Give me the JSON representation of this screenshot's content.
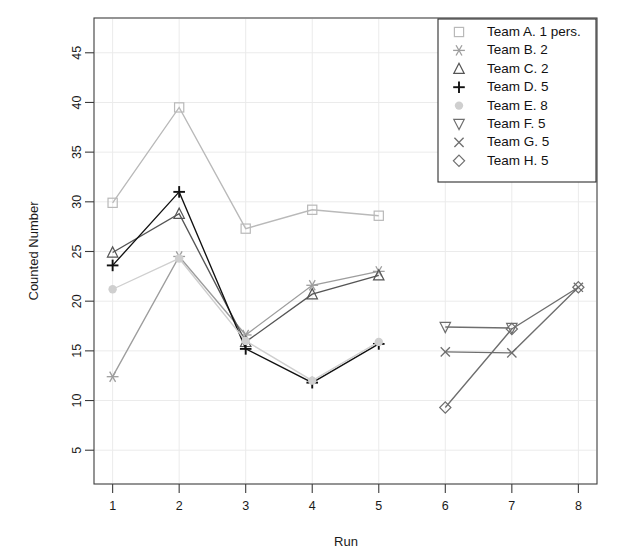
{
  "chart_data": {
    "type": "line",
    "title": "",
    "xlabel": "Run",
    "ylabel": "Counted Number",
    "xlim": [
      0.72,
      8.28
    ],
    "ylim": [
      1.6,
      48.5
    ],
    "xticks": [
      1,
      2,
      3,
      4,
      5,
      6,
      7,
      8
    ],
    "xticklabels": [
      "1",
      "2",
      "3",
      "4",
      "5",
      "6",
      "7",
      "8"
    ],
    "yticks": [
      5,
      10,
      15,
      20,
      25,
      30,
      35,
      40,
      45
    ],
    "yticklabels": [
      "5",
      "10",
      "15",
      "20",
      "25",
      "30",
      "35",
      "40",
      "45"
    ],
    "grid": true,
    "grid_color": "#ebebeb",
    "legend_position": "top-right",
    "series": [
      {
        "name": "Team A. 1 pers.",
        "marker": "square",
        "color": "#b9b9b9",
        "x": [
          1,
          2,
          3,
          4,
          5
        ],
        "values": [
          29.9,
          39.5,
          27.3,
          29.2,
          28.6
        ]
      },
      {
        "name": "Team B. 2",
        "marker": "asterisk",
        "color": "#9d9d9d",
        "x": [
          1,
          2,
          3,
          4,
          5
        ],
        "values": [
          12.4,
          24.5,
          16.6,
          21.6,
          23.0
        ]
      },
      {
        "name": "Team C. 2",
        "marker": "triangle-up",
        "color": "#555555",
        "x": [
          1,
          2,
          3,
          4,
          5
        ],
        "values": [
          24.9,
          28.8,
          15.9,
          20.7,
          22.6
        ]
      },
      {
        "name": "Team D. 5",
        "marker": "plus",
        "color": "#111111",
        "x": [
          1,
          2,
          3,
          4,
          5
        ],
        "values": [
          23.6,
          31.0,
          15.2,
          11.8,
          15.7
        ]
      },
      {
        "name": "Team E. 8",
        "marker": "dot",
        "color": "#cfcfcf",
        "x": [
          1,
          2,
          3,
          4,
          5
        ],
        "values": [
          21.2,
          24.3,
          16.0,
          12.0,
          15.9
        ]
      },
      {
        "name": "Team F. 5",
        "marker": "triangle-down",
        "color": "#6e6e6e",
        "x": [
          6,
          7
        ],
        "values": [
          17.4,
          17.3
        ]
      },
      {
        "name": "Team G. 5",
        "marker": "cross",
        "color": "#6e6e6e",
        "x": [
          6,
          7,
          8
        ],
        "values": [
          14.9,
          14.8,
          21.4
        ]
      },
      {
        "name": "Team H. 5",
        "marker": "diamond",
        "color": "#6e6e6e",
        "x": [
          6,
          7,
          8
        ],
        "values": [
          9.3,
          17.2,
          21.4
        ]
      }
    ]
  },
  "legend": {
    "items": [
      {
        "label": "Team A. 1 pers.",
        "marker": "square-icon"
      },
      {
        "label": "Team B. 2",
        "marker": "asterisk-icon"
      },
      {
        "label": "Team C. 2",
        "marker": "triangle-up-icon"
      },
      {
        "label": "Team D. 5",
        "marker": "plus-icon"
      },
      {
        "label": "Team E. 8",
        "marker": "dot-icon"
      },
      {
        "label": "Team F. 5",
        "marker": "triangle-down-icon"
      },
      {
        "label": "Team G. 5",
        "marker": "cross-icon"
      },
      {
        "label": "Team H. 5",
        "marker": "diamond-icon"
      }
    ]
  }
}
